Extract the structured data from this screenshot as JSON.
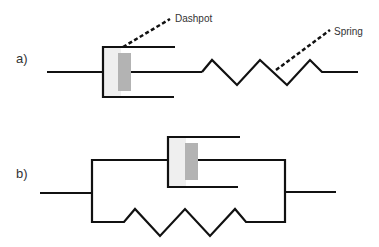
{
  "figure": {
    "panels": [
      {
        "id": "a",
        "label": "a)",
        "arrangement": "series",
        "components": [
          "dashpot",
          "spring"
        ]
      },
      {
        "id": "b",
        "label": "b)",
        "arrangement": "parallel",
        "components": [
          "dashpot",
          "spring"
        ]
      }
    ],
    "callouts": {
      "dashpot": "Dashpot",
      "spring": "Spring"
    },
    "colors": {
      "line": "#111111",
      "piston": "#b3b3b3",
      "cylinder_fill": "#efefef",
      "text": "#333333"
    }
  }
}
